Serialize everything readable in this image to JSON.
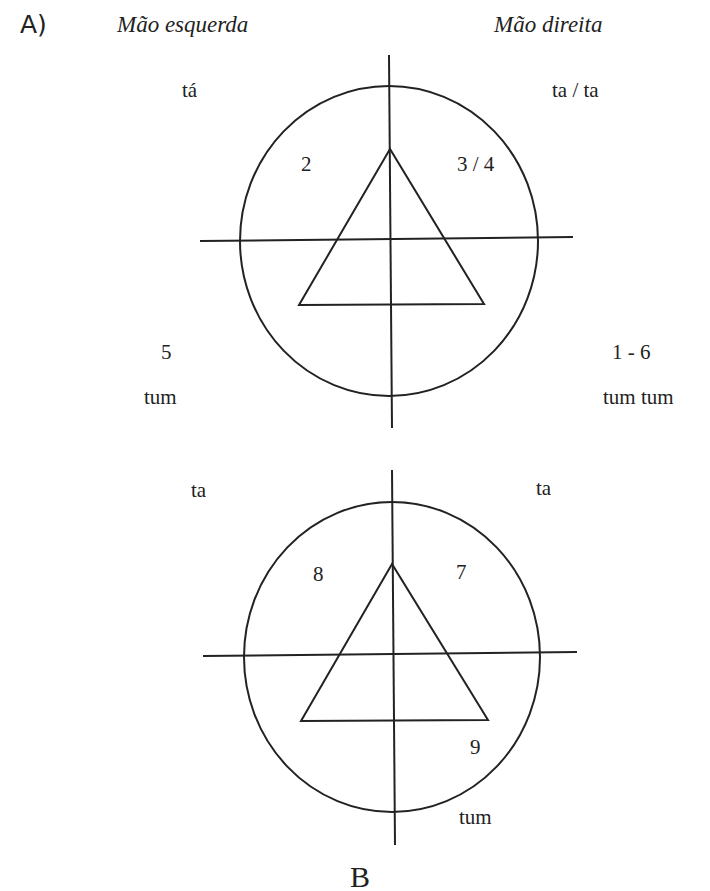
{
  "panel_label": "A)",
  "headers": {
    "left_hand": "Mão esquerda",
    "right_hand": "Mão direita"
  },
  "diagram_top": {
    "top_left_sound": "tá",
    "top_right_sound": "ta / ta",
    "quadrant_upper_left": "2",
    "quadrant_upper_right": "3 / 4",
    "bottom_left_number": "5",
    "bottom_left_sound": "tum",
    "bottom_right_number": "1 - 6",
    "bottom_right_sound": "tum tum"
  },
  "diagram_bottom": {
    "top_left_sound": "ta",
    "top_right_sound": "ta",
    "quadrant_upper_left": "8",
    "quadrant_upper_right": "7",
    "quadrant_lower_right": "9",
    "bottom_sound": "tum"
  },
  "footer_partial": "B",
  "colors": {
    "stroke": "#222222",
    "background": "#ffffff"
  }
}
